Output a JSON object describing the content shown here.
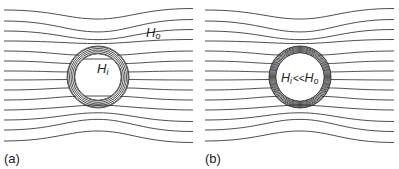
{
  "figure": {
    "panels": [
      {
        "id": "a",
        "caption": "(a)",
        "outer_label": "H",
        "outer_sub": "o",
        "inner_label": "H",
        "inner_sub": "i",
        "description": "Field lines around a spherical magnetic shield; some field penetrates interior"
      },
      {
        "id": "b",
        "caption": "(b)",
        "inner_label": "H",
        "inner_sub": "i",
        "relation": "<<",
        "inner_label2": "H",
        "inner_sub2": "o",
        "description": "High-permeability shield; interior field much less than exterior"
      }
    ],
    "colors": {
      "line": "#3a3a3a",
      "background": "#ffffff"
    }
  }
}
